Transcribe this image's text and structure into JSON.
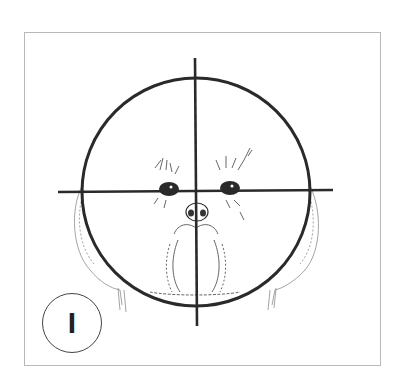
{
  "figure": {
    "label": "I",
    "guides": {
      "circle": {
        "cx": 196,
        "cy": 192,
        "r": 114
      },
      "vertical_line": {
        "x": 195,
        "y1": 58,
        "y2": 326
      },
      "horizontal_line": {
        "y": 191,
        "x1": 58,
        "x2": 333
      }
    },
    "colors": {
      "line": "#2a2a2a",
      "frame": "#b8b8b8",
      "sketch": "#6a6a6a",
      "background": "#ffffff"
    }
  }
}
